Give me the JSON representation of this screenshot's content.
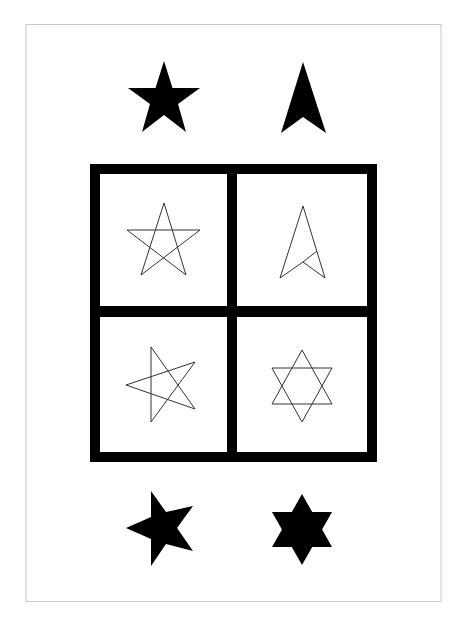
{
  "puzzle": {
    "type": "figure-matrix-analogy",
    "ink_color": "#000000",
    "frame_color": "#c8c8c8",
    "background": "#ffffff",
    "top_figures": [
      {
        "id": "five-point-star-filled",
        "style": "filled"
      },
      {
        "id": "arrowhead-filled",
        "style": "filled"
      }
    ],
    "grid_cells": [
      {
        "id": "five-point-star-outline",
        "style": "outline"
      },
      {
        "id": "arrowhead-outline",
        "style": "outline"
      },
      {
        "id": "rotated-five-point-star-outline",
        "style": "outline"
      },
      {
        "id": "six-point-star-outline",
        "style": "outline"
      }
    ],
    "bottom_figures": [
      {
        "id": "rotated-five-point-star-filled",
        "style": "filled"
      },
      {
        "id": "six-point-star-filled",
        "style": "filled"
      }
    ]
  }
}
